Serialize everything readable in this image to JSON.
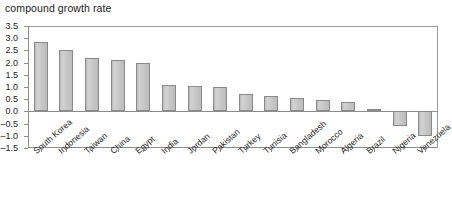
{
  "chart_data": {
    "type": "bar",
    "title": "compound growth rate",
    "xlabel": "",
    "ylabel": "",
    "ylim": [
      -1.5,
      3.5
    ],
    "ytick_step": 0.5,
    "grid": false,
    "legend": null,
    "orientation": "vertical",
    "bar_color": "#c9c9c9",
    "bar_border_color": "#8a8a8a",
    "axis_color": "#8d8d8d",
    "categories": [
      "South Korea",
      "Indonesia",
      "Taiwan",
      "China",
      "Egypt",
      "India",
      "Jordan",
      "Pakistan",
      "Turkey",
      "Tunisia",
      "Bangladesh",
      "Morocco",
      "Algeria",
      "Brazil",
      "Nigeria",
      "Venezuela"
    ],
    "values": [
      2.85,
      2.5,
      2.2,
      2.1,
      2.0,
      1.1,
      1.05,
      1.0,
      0.7,
      0.65,
      0.55,
      0.45,
      0.4,
      0.1,
      -0.6,
      -1.0
    ],
    "ytick_labels": [
      "3.5",
      "3.0",
      "2.5",
      "2.0",
      "1.5",
      "1.0",
      "0.5",
      "0.0",
      "-0.5",
      "-1.0",
      "-1.5"
    ],
    "ytick_values": [
      3.5,
      3.0,
      2.5,
      2.0,
      1.5,
      1.0,
      0.5,
      0.0,
      -0.5,
      -1.0,
      -1.5
    ]
  }
}
